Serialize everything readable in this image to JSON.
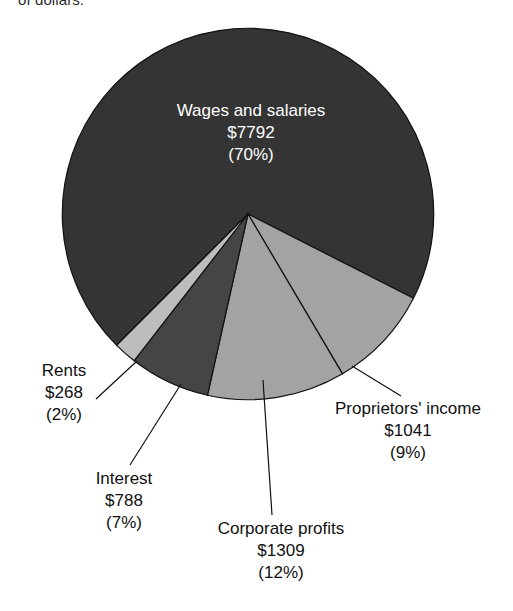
{
  "caption_fragment": "of dollars.",
  "chart_data": {
    "type": "pie",
    "title": "",
    "xlabel": "",
    "ylabel": "",
    "legend_position": "none",
    "grid": false,
    "units": "billions of dollars",
    "total_label": "",
    "categories": [
      "Wages and salaries",
      "Proprietors' income",
      "Corporate profits",
      "Interest",
      "Rents"
    ],
    "values": [
      7792,
      1041,
      1309,
      788,
      268
    ],
    "percents": [
      70,
      9,
      12,
      7,
      2
    ],
    "value_labels": [
      "$7792",
      "$1041",
      "$1309",
      "$788",
      "$268"
    ],
    "percent_labels": [
      "(70%)",
      "(9%)",
      "(12%)",
      "(7%)",
      "(2%)"
    ],
    "slice_colors": [
      "#343434",
      "#a3a3a3",
      "#a3a3a3",
      "#454545",
      "#bdbdbd"
    ],
    "slices": [
      {
        "name": "Wages and salaries",
        "value": 7792,
        "percent": 70,
        "value_label": "$7792",
        "percent_label": "(70%)",
        "color": "#343434",
        "label_placement": "inside",
        "label_color": "#ffffff"
      },
      {
        "name": "Proprietors' income",
        "value": 1041,
        "percent": 9,
        "value_label": "$1041",
        "percent_label": "(9%)",
        "color": "#a3a3a3",
        "label_placement": "outside-right",
        "label_color": "#111111"
      },
      {
        "name": "Corporate profits",
        "value": 1309,
        "percent": 12,
        "value_label": "$1309",
        "percent_label": "(12%)",
        "color": "#a3a3a3",
        "label_placement": "outside-bottom",
        "label_color": "#111111"
      },
      {
        "name": "Interest",
        "value": 788,
        "percent": 7,
        "value_label": "$788",
        "percent_label": "(7%)",
        "color": "#454545",
        "label_placement": "outside-bottom-left",
        "label_color": "#111111"
      },
      {
        "name": "Rents",
        "value": 268,
        "percent": 2,
        "value_label": "$268",
        "percent_label": "(2%)",
        "color": "#bdbdbd",
        "label_placement": "outside-left",
        "label_color": "#111111"
      }
    ]
  }
}
